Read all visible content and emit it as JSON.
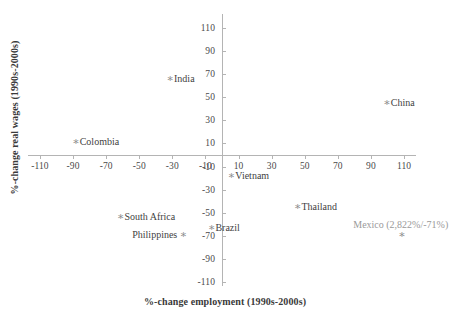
{
  "chart_data": {
    "type": "scatter",
    "title": "",
    "xlabel": "%-change employment (1990s-2000s)",
    "ylabel": "%-change real wages (1990s-2000s)",
    "xlim": [
      -120,
      120
    ],
    "ylim": [
      -120,
      120
    ],
    "grid": false,
    "legend": "none",
    "xticks": [
      "-110",
      "-90",
      "-70",
      "-50",
      "-30",
      "-10",
      "10",
      "30",
      "50",
      "70",
      "90",
      "110"
    ],
    "xtick_values": [
      -110,
      -90,
      -70,
      -50,
      -30,
      -10,
      10,
      30,
      50,
      70,
      90,
      110
    ],
    "yticks": [
      "110",
      "90",
      "70",
      "50",
      "30",
      "10",
      "-10",
      "-30",
      "-50",
      "-70",
      "-90",
      "-110"
    ],
    "ytick_values": [
      110,
      90,
      70,
      50,
      30,
      10,
      -10,
      -30,
      -50,
      -70,
      -90,
      -110
    ],
    "marker": "asterisk",
    "marker_color": "#8d8d8d",
    "points": [
      {
        "label": "India",
        "x": -32,
        "y": 67,
        "label_pos": "right",
        "muted": false
      },
      {
        "label": "China",
        "x": 99,
        "y": 46,
        "label_pos": "right",
        "muted": false
      },
      {
        "label": "Colombia",
        "x": -89,
        "y": 12,
        "label_pos": "right",
        "muted": false
      },
      {
        "label": "Vietnam",
        "x": 5,
        "y": -17,
        "label_pos": "right",
        "muted": false
      },
      {
        "label": "Thailand",
        "x": 45,
        "y": -44,
        "label_pos": "right",
        "muted": false
      },
      {
        "label": "South Africa",
        "x": -62,
        "y": -53,
        "label_pos": "right",
        "muted": false
      },
      {
        "label": "Brazil",
        "x": -7,
        "y": -62,
        "label_pos": "right",
        "muted": false
      },
      {
        "label": "Philippines",
        "x": -24,
        "y": -68,
        "label_pos": "left",
        "muted": false
      },
      {
        "label": "Mexico (2,822%/-71%)",
        "x": 108,
        "y": -68,
        "label_pos": "above",
        "muted": true
      }
    ]
  },
  "colors": {
    "axis": "#b4b4b4",
    "text": "#3f3f3f",
    "marker": "#8d8d8d",
    "muted_text": "#9a9a9a",
    "background": "#ffffff"
  }
}
